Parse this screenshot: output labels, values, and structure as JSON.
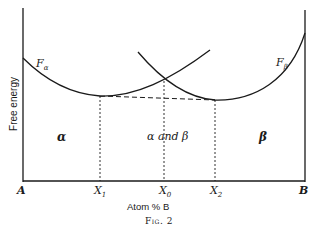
{
  "figure": {
    "caption": "Fig. 2",
    "y_axis_label": "Free energy",
    "x_axis_label": "Atom % B",
    "x_ticks": {
      "A": "A",
      "X1": "X",
      "X1_sub": "1",
      "X0": "X",
      "X0_sub": "0",
      "X2": "X",
      "X2_sub": "2",
      "B": "B"
    },
    "curves": {
      "alpha": {
        "label": "F",
        "sub": "α"
      },
      "beta": {
        "label": "F",
        "sub": "β"
      }
    },
    "regions": {
      "alpha": "α",
      "alpha_beta": "α and β",
      "beta": "β"
    }
  },
  "colors": {
    "ink": "#1a1a1a",
    "background": "#ffffff"
  }
}
